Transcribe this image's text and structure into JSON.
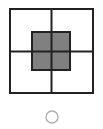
{
  "diagram": {
    "grid": {
      "x": 10,
      "y": 9,
      "size": 84,
      "stroke": "#222222",
      "stroke_width": 2
    },
    "center_square": {
      "x": 32,
      "y": 32,
      "size": 38,
      "fill": "#808080",
      "stroke": "#222222"
    },
    "radio_circle": {
      "cx": 52,
      "cy": 117,
      "r": 6,
      "stroke": "#b0b0b0",
      "selected": false
    }
  }
}
